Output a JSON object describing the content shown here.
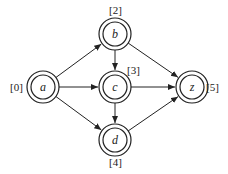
{
  "diagram": {
    "type": "directed-graph",
    "nodes": [
      {
        "id": "a",
        "label": "a",
        "weight": "[0]",
        "x": 43,
        "y": 87,
        "weight_x": 10,
        "weight_y": 91
      },
      {
        "id": "b",
        "label": "b",
        "weight": "[2]",
        "x": 115,
        "y": 34,
        "weight_x": 109,
        "weight_y": 14
      },
      {
        "id": "c",
        "label": "c",
        "weight": "[3]",
        "x": 115,
        "y": 87,
        "weight_x": 127,
        "weight_y": 74
      },
      {
        "id": "z",
        "label": "z",
        "weight": "[5]",
        "x": 192,
        "y": 87,
        "weight_x": 206,
        "weight_y": 91
      },
      {
        "id": "d",
        "label": "d",
        "weight": "[4]",
        "x": 115,
        "y": 140,
        "weight_x": 109,
        "weight_y": 166
      }
    ],
    "edges": [
      {
        "from": "a",
        "to": "b"
      },
      {
        "from": "a",
        "to": "c"
      },
      {
        "from": "a",
        "to": "d"
      },
      {
        "from": "b",
        "to": "c"
      },
      {
        "from": "b",
        "to": "z"
      },
      {
        "from": "c",
        "to": "z"
      },
      {
        "from": "c",
        "to": "d"
      },
      {
        "from": "d",
        "to": "z"
      }
    ],
    "colors": {
      "stroke": "#222222",
      "background": "#ffffff"
    }
  }
}
